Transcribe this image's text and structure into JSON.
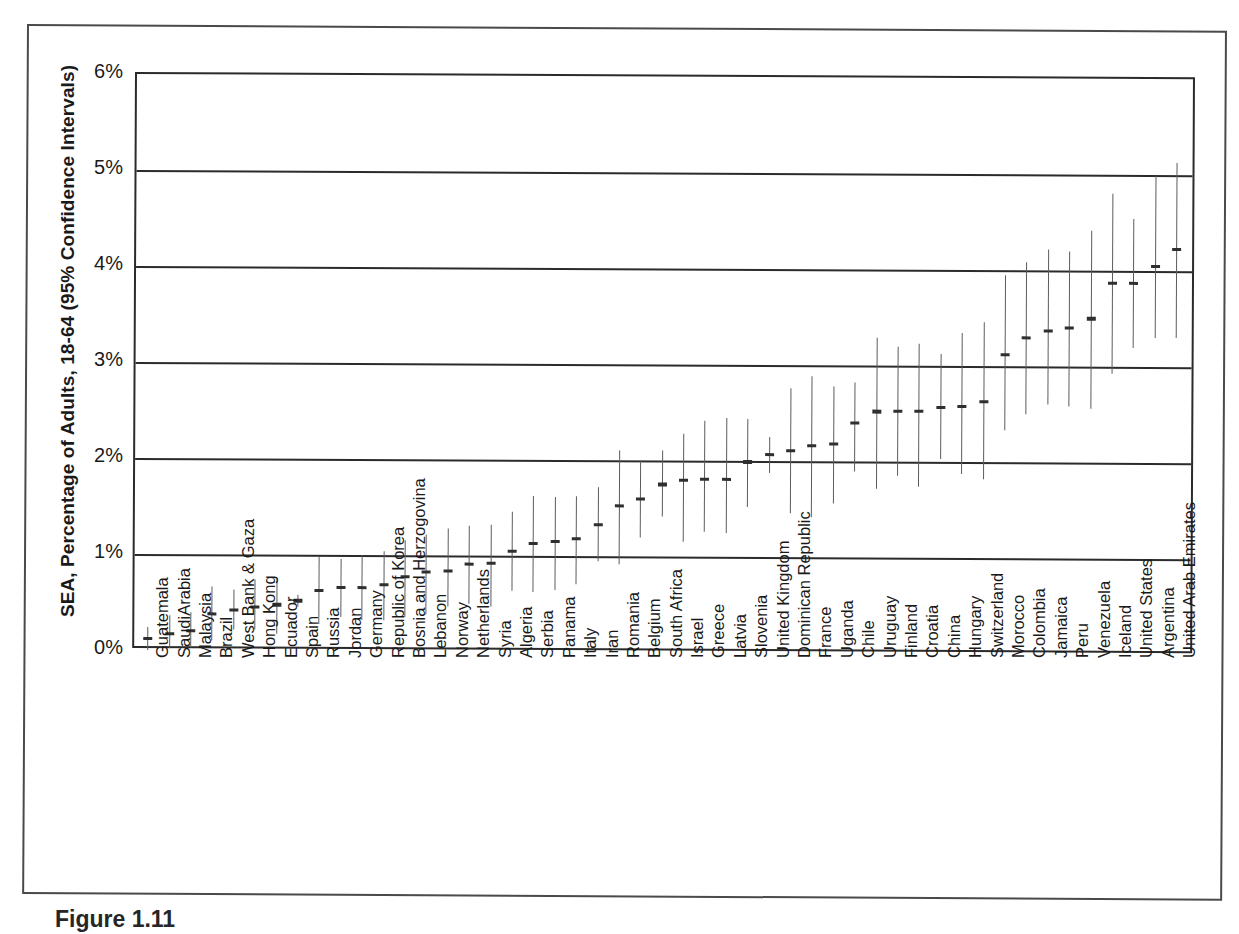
{
  "figure": {
    "caption": "Figure 1.11",
    "y_axis_title": "SEA, Percentage of Adults, 18-64 (95% Confidence Intervals)"
  },
  "chart_data": {
    "type": "scatter",
    "title": "",
    "subtitle": "",
    "xlabel": "",
    "ylabel": "SEA, Percentage of Adults, 18-64 (95% Confidence Intervals)",
    "ylim": [
      0,
      6
    ],
    "ytick_labels": [
      "0%",
      "1%",
      "2%",
      "3%",
      "4%",
      "5%",
      "6%"
    ],
    "ytick_values": [
      0,
      1,
      2,
      3,
      4,
      5,
      6
    ],
    "grid": true,
    "legend": "none",
    "value_unit": "percent",
    "error_bars": "95% confidence interval",
    "categories": [
      "Guatemala",
      "SaudiArabia",
      "Malaysia",
      "Brazil",
      "West Bank & Gaza",
      "Hong Kong",
      "Ecuador",
      "Spain",
      "Russia",
      "Jordan",
      "Germany",
      "Republic of Korea",
      "Bosnia and Herzogovina",
      "Lebanon",
      "Norway",
      "Netherlands",
      "Syria",
      "Algeria",
      "Serbia",
      "Panama",
      "Italy",
      "Iran",
      "Romania",
      "Belgium",
      "South Africa",
      "Israel",
      "Greece",
      "Latvia",
      "Slovenia",
      "United Kingdom",
      "Dominican Republic",
      "France",
      "Uganda",
      "Chile",
      "Uruguay",
      "Finland",
      "Croatia",
      "China",
      "Hungary",
      "Switzerland",
      "Morocco",
      "Colombia",
      "Jamaica",
      "Peru",
      "Venezuela",
      "Iceland",
      "United States",
      "Argentina",
      "United Arab Emirates"
    ],
    "values": [
      0.12,
      0.17,
      0.2,
      0.38,
      0.42,
      0.45,
      0.48,
      0.52,
      0.63,
      0.66,
      0.66,
      0.69,
      0.78,
      0.83,
      0.84,
      0.91,
      0.92,
      1.05,
      1.13,
      1.15,
      1.18,
      1.33,
      1.53,
      1.6,
      1.75,
      1.8,
      1.81,
      1.81,
      1.99,
      2.07,
      2.11,
      2.16,
      2.18,
      2.4,
      2.52,
      2.53,
      2.53,
      2.57,
      2.58,
      2.63,
      3.12,
      3.3,
      3.37,
      3.4,
      3.5,
      3.87,
      3.87,
      4.05,
      4.22
    ],
    "ci_low": [
      0.0,
      0.02,
      0.03,
      0.1,
      0.22,
      0.22,
      0.18,
      0.46,
      0.28,
      0.35,
      0.32,
      0.32,
      0.35,
      0.39,
      0.47,
      0.5,
      0.47,
      0.64,
      0.63,
      0.65,
      0.71,
      0.95,
      0.92,
      1.2,
      1.42,
      1.16,
      1.26,
      1.25,
      1.52,
      1.88,
      1.46,
      1.42,
      1.56,
      1.9,
      1.72,
      1.85,
      1.74,
      2.03,
      1.87,
      1.82,
      2.33,
      2.5,
      2.6,
      2.58,
      2.56,
      2.93,
      3.2,
      3.3,
      3.3
    ],
    "ci_high": [
      0.24,
      0.36,
      0.4,
      0.67,
      0.64,
      0.74,
      0.76,
      0.58,
      0.98,
      0.96,
      1.0,
      1.04,
      1.16,
      1.22,
      1.28,
      1.31,
      1.32,
      1.46,
      1.62,
      1.61,
      1.63,
      1.72,
      2.1,
      2.0,
      2.1,
      2.28,
      2.42,
      2.45,
      2.44,
      2.25,
      2.76,
      2.89,
      2.78,
      2.82,
      3.29,
      3.2,
      3.23,
      3.12,
      3.34,
      3.46,
      3.95,
      4.08,
      4.22,
      4.2,
      4.42,
      4.8,
      4.54,
      4.99,
      5.12
    ]
  }
}
